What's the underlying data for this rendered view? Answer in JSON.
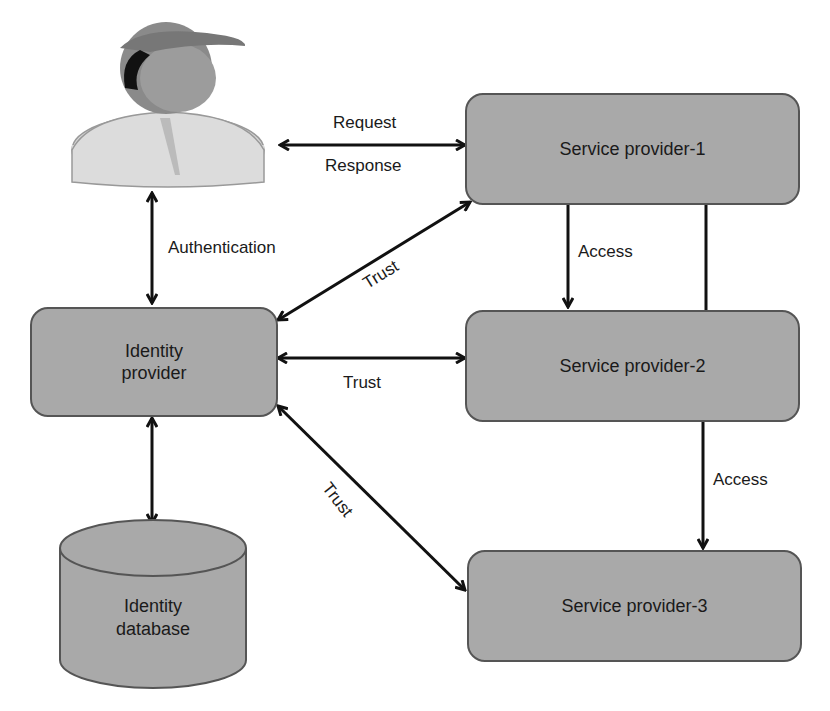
{
  "nodes": {
    "user": {
      "label": "User"
    },
    "identity_provider": {
      "label_line1": "Identity",
      "label_line2": "provider"
    },
    "identity_database": {
      "label_line1": "Identity",
      "label_line2": "database"
    },
    "sp1": {
      "label": "Service provider-1"
    },
    "sp2": {
      "label": "Service provider-2"
    },
    "sp3": {
      "label": "Service provider-3"
    }
  },
  "edges": {
    "request": "Request",
    "response": "Response",
    "authentication": "Authentication",
    "trust_sp1": "Trust",
    "trust_sp2": "Trust",
    "trust_sp3": "Trust",
    "access_sp1_sp2": "Access",
    "access_sp2_sp3": "Access"
  },
  "colors": {
    "box_fill": "#a9a9a9",
    "box_border": "#555555",
    "arrow": "#111111"
  }
}
